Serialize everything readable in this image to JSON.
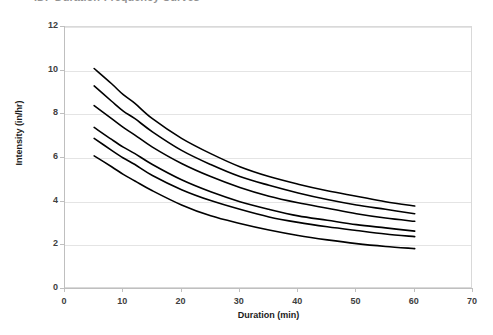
{
  "title": "IDF Duration-Frequency Curves",
  "chart_data": {
    "type": "line",
    "title": "IDF Duration-Frequency Curves",
    "xlabel": "Duration (min)",
    "ylabel": "Intensity (in/hr)",
    "xlim": [
      0,
      70
    ],
    "ylim": [
      0,
      12
    ],
    "xticks": [
      0,
      10,
      20,
      30,
      40,
      50,
      60,
      70
    ],
    "yticks": [
      0,
      2,
      4,
      6,
      8,
      10,
      12
    ],
    "grid": "horizontal",
    "legend": "none",
    "x": [
      5,
      8,
      10,
      12,
      15,
      20,
      25,
      30,
      35,
      40,
      45,
      50,
      55,
      60
    ],
    "series": [
      {
        "name": "curve-1",
        "values": [
          10.1,
          9.4,
          8.9,
          8.5,
          7.8,
          6.9,
          6.2,
          5.6,
          5.15,
          4.8,
          4.5,
          4.25,
          4.0,
          3.8
        ]
      },
      {
        "name": "curve-2",
        "values": [
          9.3,
          8.6,
          8.15,
          7.8,
          7.2,
          6.35,
          5.7,
          5.15,
          4.75,
          4.4,
          4.1,
          3.85,
          3.65,
          3.45
        ]
      },
      {
        "name": "curve-3",
        "values": [
          8.4,
          7.8,
          7.4,
          7.05,
          6.5,
          5.75,
          5.15,
          4.65,
          4.25,
          3.95,
          3.7,
          3.45,
          3.25,
          3.1
        ]
      },
      {
        "name": "curve-4",
        "values": [
          7.4,
          6.85,
          6.5,
          6.2,
          5.7,
          5.0,
          4.45,
          4.0,
          3.65,
          3.35,
          3.15,
          2.95,
          2.8,
          2.65
        ]
      },
      {
        "name": "curve-5",
        "values": [
          6.9,
          6.35,
          6.0,
          5.7,
          5.2,
          4.55,
          4.05,
          3.65,
          3.3,
          3.05,
          2.85,
          2.68,
          2.52,
          2.4
        ]
      },
      {
        "name": "curve-6",
        "values": [
          6.1,
          5.6,
          5.25,
          4.95,
          4.5,
          3.85,
          3.35,
          3.0,
          2.7,
          2.45,
          2.25,
          2.08,
          1.95,
          1.85
        ]
      }
    ],
    "line_color": "#000000",
    "line_width": 1.6,
    "grid_color": "#e4e4e4",
    "axis_color": "#bfbfbf",
    "plot_border_color": "#d9d9d9"
  }
}
